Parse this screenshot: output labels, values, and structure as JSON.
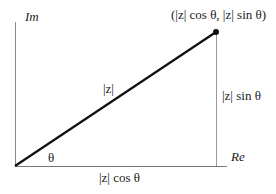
{
  "diagram": {
    "type": "complex-plane-polar-form",
    "axes": {
      "vertical_label": "Im",
      "horizontal_label": "Re"
    },
    "labels": {
      "point": "(|z| cos θ, |z| sin θ)",
      "hypotenuse": "|z|",
      "vertical_leg": "|z| sin θ",
      "horizontal_leg": "|z| cos θ",
      "angle": "θ"
    },
    "colors": {
      "axis": "#888888",
      "vector": "#111111",
      "text": "#222222"
    }
  }
}
